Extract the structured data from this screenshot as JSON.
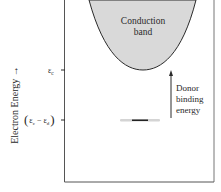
{
  "diagram": {
    "y_axis_label": "Electron Energy →",
    "band_label_line1": "Conduction",
    "band_label_line2": "band",
    "ec_label": "ε",
    "ec_sub": "c",
    "donor_level_label_open": "(",
    "donor_level_label_eps1": "ε",
    "donor_level_label_sub1": "c",
    "donor_level_label_minus": "−",
    "donor_level_label_eps2": "ε",
    "donor_level_label_sub2": "d",
    "donor_level_label_close": ")",
    "arrow_label_line1": "Donor",
    "arrow_label_line2": "binding",
    "arrow_label_line3": "energy",
    "colors": {
      "band_fill": "#d9d9d9",
      "line": "#2a2a2a",
      "frame": "#555555"
    }
  }
}
